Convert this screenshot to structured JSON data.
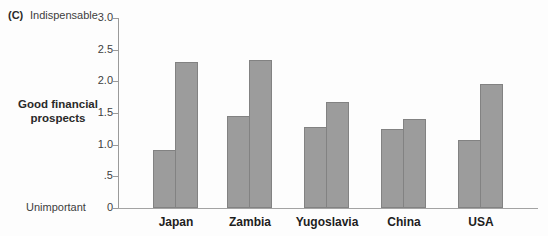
{
  "figure": {
    "panel_label": "(C)"
  },
  "chart_data": {
    "type": "bar",
    "title": "",
    "xlabel": "",
    "ylabel": "",
    "categories": [
      "Japan",
      "Zambia",
      "Yugoslavia",
      "China",
      "USA"
    ],
    "series": [
      {
        "name": "left-bar",
        "values": [
          0.92,
          1.46,
          1.28,
          1.25,
          1.08
        ]
      },
      {
        "name": "right-bar",
        "values": [
          2.3,
          2.34,
          1.68,
          1.4,
          1.96
        ]
      }
    ],
    "ylim": [
      0,
      3.0
    ],
    "yticks": [
      {
        "label": "3.0",
        "value": 3.0
      },
      {
        "label": "2.5",
        "value": 2.5
      },
      {
        "label": "2.0",
        "value": 2.0
      },
      {
        "label": "1.5",
        "value": 1.5
      },
      {
        "label": "1.0",
        "value": 1.0
      },
      {
        "label": ".5",
        "value": 0.5
      },
      {
        "label": "0",
        "value": 0
      }
    ],
    "y_annotations": [
      {
        "label": "Indispensable",
        "value": 3.0,
        "bold": false
      },
      {
        "label": "Good financial prospects",
        "value": 1.5,
        "bold": true
      },
      {
        "label": "Unimportant",
        "value": 0,
        "bold": false
      }
    ],
    "legend_position": "none",
    "grid": false,
    "colors": {
      "bar_fill": "#9c9c9c",
      "bar_edge": "#828282",
      "axis": "#9a9a9a",
      "tick_text": "#3d3d3d",
      "category_text": "#1e1e1e",
      "background": "#fdfdfd"
    }
  }
}
